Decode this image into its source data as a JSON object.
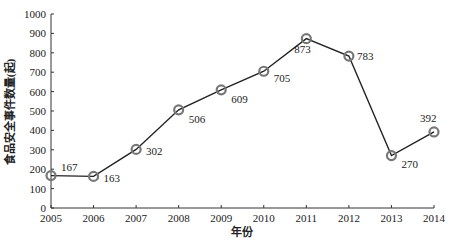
{
  "chart_data": {
    "type": "line",
    "title": "",
    "xlabel": "年份",
    "ylabel": "食品安全事件数量(起)",
    "x": [
      "2005",
      "2006",
      "2007",
      "2008",
      "2009",
      "2010",
      "2011",
      "2012",
      "2013",
      "2014"
    ],
    "series": [
      {
        "name": "食品安全事件数量",
        "values": [
          167,
          163,
          302,
          506,
          609,
          705,
          873,
          783,
          270,
          392
        ],
        "marker": "circle",
        "color": "#222222",
        "marker_color": "#777777"
      }
    ],
    "ylim": [
      0,
      1000
    ],
    "yticks": [
      0,
      100,
      200,
      300,
      400,
      500,
      600,
      700,
      800,
      900,
      1000
    ],
    "grid": false,
    "legend": "none",
    "data_labels": [
      "167",
      "163",
      "302",
      "506",
      "609",
      "705",
      "873",
      "783",
      "270",
      "392"
    ]
  }
}
